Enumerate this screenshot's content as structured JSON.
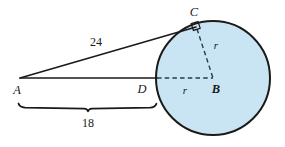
{
  "figure": {
    "kind": "geometry-diagram",
    "background_color": "#ffffff",
    "circle_fill_color": "#c9e5f3",
    "stroke_color": "#1a1a1a",
    "dashed_color": "#2b3a45"
  },
  "points": [
    {
      "id": "A",
      "label": "A",
      "x": 20,
      "y": 78,
      "label_x": 17,
      "label_y": 90
    },
    {
      "id": "D",
      "label": "D",
      "x": 156,
      "y": 78,
      "label_x": 142,
      "label_y": 89
    },
    {
      "id": "B",
      "label": "B",
      "x": 213,
      "y": 78,
      "label_x": 216,
      "label_y": 89
    },
    {
      "id": "C",
      "label": "C",
      "x": 196,
      "y": 27,
      "label_x": 194,
      "label_y": 12
    }
  ],
  "circle": {
    "center_x": 213,
    "center_y": 78,
    "radius": 57
  },
  "segments": [
    {
      "id": "tangent-AC",
      "from": "A",
      "to": "C",
      "style": "solid",
      "label": "24"
    },
    {
      "id": "secant-AB",
      "from": "A",
      "to": "D",
      "style": "solid",
      "label": ""
    },
    {
      "id": "radius-DB",
      "from": "D",
      "to": "B",
      "style": "dashed",
      "label": "r"
    },
    {
      "id": "radius-CB",
      "from": "C",
      "to": "B",
      "style": "dashed",
      "label": "r"
    }
  ],
  "measure_labels": [
    {
      "id": "length-24",
      "text": "24",
      "x": 96,
      "y": 42
    },
    {
      "id": "radius-r-cb",
      "text": "r",
      "x": 216,
      "y": 45
    },
    {
      "id": "radius-r-db",
      "text": "r",
      "x": 185,
      "y": 90
    },
    {
      "id": "length-18",
      "text": "18",
      "x": 88,
      "y": 123
    }
  ],
  "brace": {
    "id": "brace-AD",
    "label": "18",
    "left_x": 18,
    "right_x": 156,
    "y": 107
  },
  "right_angle": {
    "id": "right-angle-at-C",
    "at_point": "C",
    "size": 9
  }
}
